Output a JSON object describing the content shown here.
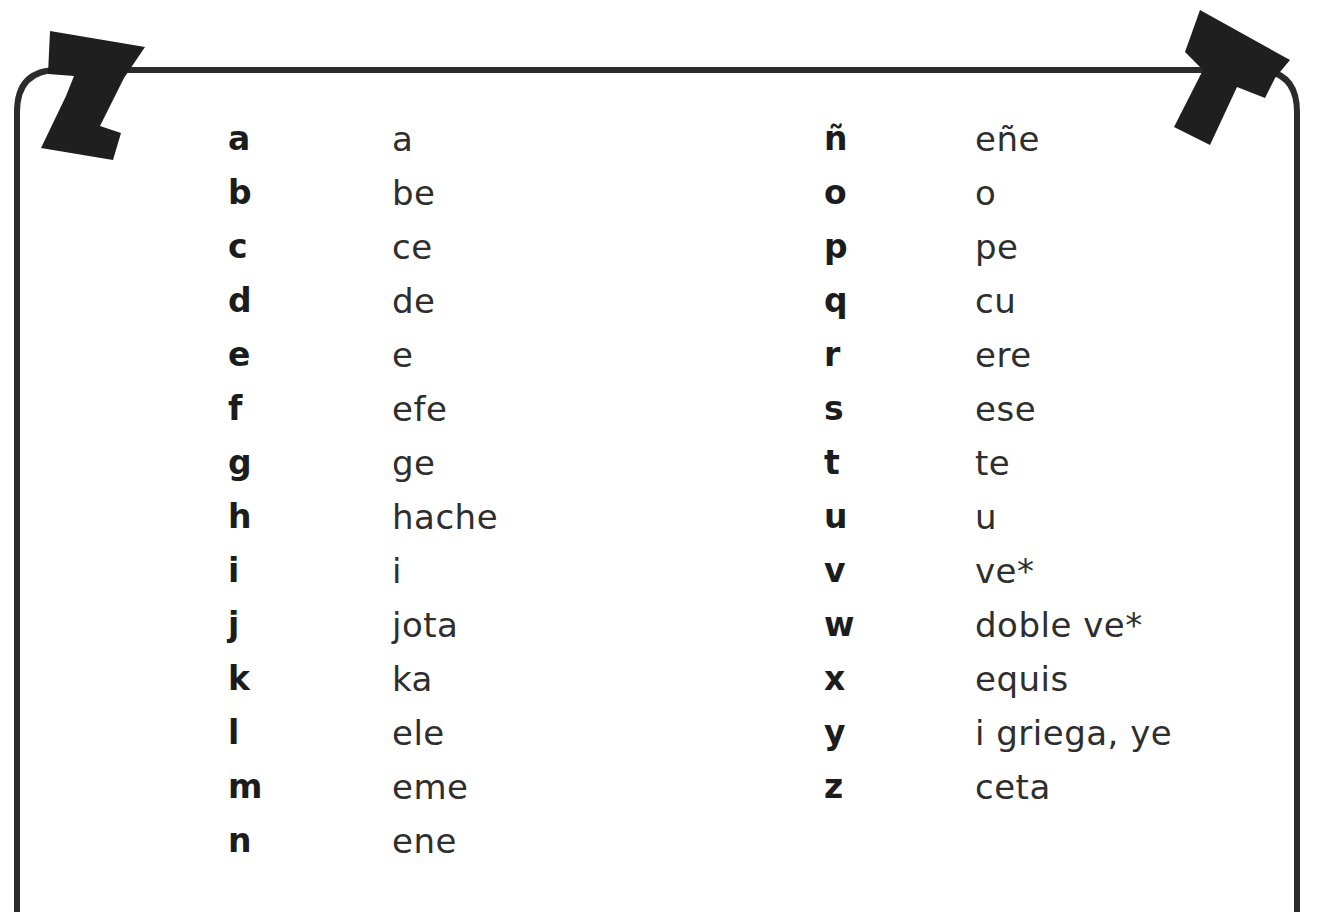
{
  "alphabet": {
    "left": [
      {
        "letter": "a",
        "name": "a"
      },
      {
        "letter": "b",
        "name": "be"
      },
      {
        "letter": "c",
        "name": "ce"
      },
      {
        "letter": "d",
        "name": "de"
      },
      {
        "letter": "e",
        "name": "e"
      },
      {
        "letter": "f",
        "name": "efe"
      },
      {
        "letter": "g",
        "name": "ge"
      },
      {
        "letter": "h",
        "name": "hache"
      },
      {
        "letter": "i",
        "name": "i"
      },
      {
        "letter": "j",
        "name": "jota"
      },
      {
        "letter": "k",
        "name": "ka"
      },
      {
        "letter": "l",
        "name": "ele"
      },
      {
        "letter": "m",
        "name": "eme"
      },
      {
        "letter": "n",
        "name": "ene"
      }
    ],
    "right": [
      {
        "letter": "ñ",
        "name": "eñe"
      },
      {
        "letter": "o",
        "name": "o"
      },
      {
        "letter": "p",
        "name": "pe"
      },
      {
        "letter": "q",
        "name": "cu"
      },
      {
        "letter": "r",
        "name": "ere"
      },
      {
        "letter": "s",
        "name": "ese"
      },
      {
        "letter": "t",
        "name": "te"
      },
      {
        "letter": "u",
        "name": "u"
      },
      {
        "letter": "v",
        "name": "ve*"
      },
      {
        "letter": "w",
        "name": "doble ve*"
      },
      {
        "letter": "x",
        "name": "equis"
      },
      {
        "letter": "y",
        "name": "i griega, ye"
      },
      {
        "letter": "z",
        "name": "ceta"
      }
    ]
  },
  "colors": {
    "frame": "#2b2b2b",
    "tape": "#1f1f1f",
    "text": "#2a2a2a"
  }
}
